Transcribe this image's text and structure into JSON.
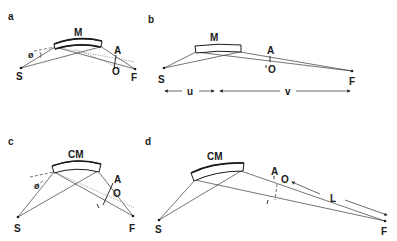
{
  "figure": {
    "panels": [
      {
        "id": "a",
        "label": "a",
        "mirror_label": "M",
        "points": {
          "source": "S",
          "focus": "F",
          "aperture": "A",
          "origin": "O"
        },
        "angle_label": "ø"
      },
      {
        "id": "b",
        "label": "b",
        "mirror_label": "M",
        "points": {
          "source": "S",
          "focus": "F",
          "aperture": "A",
          "origin": "O"
        },
        "distances": {
          "object_distance": "u",
          "image_distance": "v"
        }
      },
      {
        "id": "c",
        "label": "c",
        "mirror_label": "CM",
        "points": {
          "source": "S",
          "focus": "F",
          "aperture": "A",
          "origin": "O"
        },
        "angle_label": "ø"
      },
      {
        "id": "d",
        "label": "d",
        "mirror_label": "CM",
        "points": {
          "source": "S",
          "focus": "F",
          "aperture": "A",
          "origin": "O"
        },
        "distances": {
          "length": "L"
        }
      }
    ]
  }
}
